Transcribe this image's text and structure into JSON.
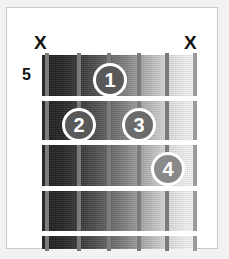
{
  "diagram": {
    "type": "guitar-chord-diagram",
    "fret_position_label": "5",
    "strings_count": 6,
    "frets_count": 4,
    "colors": {
      "page_background": "#f2f2f2",
      "card_background": "#ffffff",
      "card_border": "#c9c9c9",
      "fretboard_dark": "#1d1d1d",
      "fretboard_light": "#f7f7f7",
      "string_color": "#7b7b7b",
      "fret_color": "#ffffff",
      "marker_fill": "#6e6e6e",
      "marker_ring": "#ffffff",
      "text_color": "#111111"
    }
  },
  "mute_marks": [
    {
      "name": "mute-string-1",
      "label": "X",
      "string": 1
    },
    {
      "name": "mute-string-6",
      "label": "X",
      "string": 6
    }
  ],
  "strings": [
    {
      "index": 1,
      "x": 3,
      "shade": "dark"
    },
    {
      "index": 2,
      "x": 35,
      "shade": "dark"
    },
    {
      "index": 3,
      "x": 65,
      "shade": "dark"
    },
    {
      "index": 4,
      "x": 95,
      "shade": "dark"
    },
    {
      "index": 5,
      "x": 123,
      "shade": "dark"
    },
    {
      "index": 6,
      "x": 151,
      "shade": "light"
    }
  ],
  "frets": [
    {
      "index": 1,
      "y": 41
    },
    {
      "index": 2,
      "y": 85
    },
    {
      "index": 3,
      "y": 131
    },
    {
      "index": 4,
      "y": 176
    }
  ],
  "finger_markers": [
    {
      "number": "1",
      "string": 3,
      "fret": 1,
      "left": 51,
      "top": 8,
      "tone": "dark"
    },
    {
      "number": "2",
      "string": 2,
      "fret": 2,
      "left": 20,
      "top": 53,
      "tone": "dark"
    },
    {
      "number": "3",
      "string": 4,
      "fret": 2,
      "left": 80,
      "top": 53,
      "tone": "mid"
    },
    {
      "number": "4",
      "string": 5,
      "fret": 3,
      "left": 109,
      "top": 97,
      "tone": "lightbg"
    }
  ]
}
